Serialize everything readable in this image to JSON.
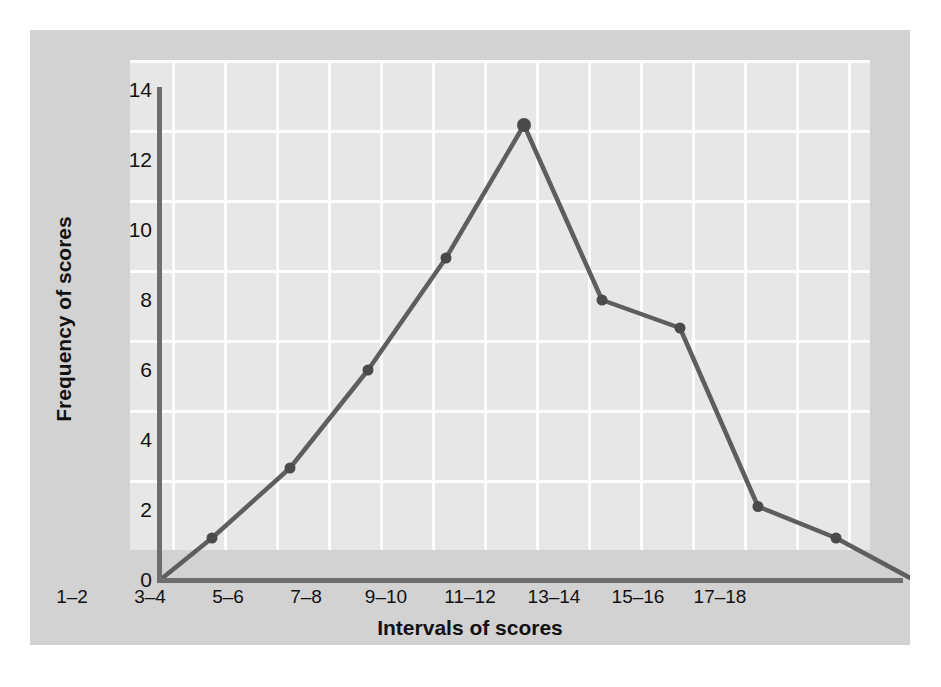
{
  "chart_data": {
    "type": "line",
    "title": "",
    "xlabel": "Intervals of scores",
    "ylabel": "Frequency of scores",
    "categories": [
      "1–2",
      "3–4",
      "5–6",
      "7–8",
      "9–10",
      "11–12",
      "13–14",
      "15–16",
      "17–18"
    ],
    "values": [
      1.2,
      3.2,
      6.0,
      9.2,
      13.0,
      8.0,
      7.2,
      2.1,
      1.2
    ],
    "anchors": {
      "left_zero": 0,
      "right_zero": 0
    },
    "ylim": [
      0,
      14
    ],
    "yticks": [
      "0",
      "2",
      "4",
      "6",
      "8",
      "10",
      "12",
      "14"
    ],
    "ytick_values": [
      0,
      2,
      4,
      6,
      8,
      10,
      12,
      14
    ],
    "grid": true,
    "legend": "none",
    "series_color": "#5e5e5e",
    "marker_color": "#4a4a4a",
    "plot_background": "#e7e7e7",
    "figure_background": "#d2d2d2",
    "grid_color": "#fdfdfd",
    "axis_color": "#6e6e6e"
  }
}
